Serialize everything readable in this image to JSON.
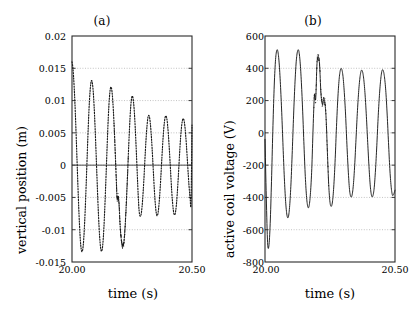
{
  "figure": {
    "background": "#ffffff",
    "line_color": "#1a1a1a",
    "grid_color": "#b4b4b4",
    "axis_color": "#2a2a2a"
  },
  "panels": [
    {
      "id": "a",
      "title": "(a)",
      "xlabel": "time (s)",
      "ylabel": "vertical position (m)",
      "xticks": [
        "20.00",
        "20.50"
      ],
      "yticks": [
        "0.02",
        "0.015",
        "0.01",
        "0.005",
        "0",
        "-0.005",
        "-0.01",
        "-0.015"
      ]
    },
    {
      "id": "b",
      "title": "(b)",
      "xlabel": "time (s)",
      "ylabel": "active coil voltage (V)",
      "xticks": [
        "20.00",
        "20.50"
      ],
      "yticks": [
        "600",
        "400",
        "200",
        "0",
        "-200",
        "-400",
        "-600",
        "-800"
      ]
    }
  ],
  "chart_data": [
    {
      "type": "line",
      "panel": "a",
      "title": "(a)",
      "xlabel": "time (s)",
      "ylabel": "vertical position (m)",
      "xlim": [
        20.0,
        20.5
      ],
      "ylim": [
        -0.015,
        0.02
      ],
      "xticks": [
        20.0,
        20.5
      ],
      "xticklabels": [
        "20.00",
        "20.50"
      ],
      "yticks": [
        0.02,
        0.015,
        0.01,
        0.005,
        0,
        -0.005,
        -0.01,
        -0.015
      ],
      "yticklabels": [
        "0.02",
        "0.015",
        "0.01",
        "0.005",
        "0",
        "-0.005",
        "-0.01",
        "-0.015"
      ],
      "grid": true,
      "grid_axis": "y",
      "linestyle": "dotted",
      "legend": null,
      "series": [
        {
          "name": "vertical position",
          "x": [
            20.0,
            20.004,
            20.008,
            20.012,
            20.016,
            20.02,
            20.024,
            20.028,
            20.032,
            20.036,
            20.04,
            20.044,
            20.048,
            20.052,
            20.056,
            20.06,
            20.064,
            20.068,
            20.072,
            20.076,
            20.08,
            20.084,
            20.088,
            20.092,
            20.096,
            20.1,
            20.104,
            20.108,
            20.112,
            20.116,
            20.12,
            20.124,
            20.128,
            20.132,
            20.136,
            20.14,
            20.144,
            20.148,
            20.152,
            20.156,
            20.16,
            20.164,
            20.168,
            20.172,
            20.176,
            20.18,
            20.184,
            20.188,
            20.192,
            20.196,
            20.2,
            20.204,
            20.208,
            20.212,
            20.216,
            20.22,
            20.224,
            20.228,
            20.232,
            20.236,
            20.24,
            20.244,
            20.248,
            20.252,
            20.256,
            20.26,
            20.264,
            20.268,
            20.272,
            20.276,
            20.28,
            20.284,
            20.288,
            20.292,
            20.296,
            20.3,
            20.304,
            20.308,
            20.312,
            20.316,
            20.32,
            20.324,
            20.328,
            20.332,
            20.336,
            20.34,
            20.344,
            20.348,
            20.352,
            20.356,
            20.36,
            20.364,
            20.368,
            20.372,
            20.376,
            20.38,
            20.384,
            20.388,
            20.392,
            20.396,
            20.4,
            20.404,
            20.408,
            20.412,
            20.416,
            20.42,
            20.424,
            20.428,
            20.432,
            20.436,
            20.44,
            20.444,
            20.448,
            20.452,
            20.456,
            20.46,
            20.464,
            20.468,
            20.472,
            20.476,
            20.48,
            20.484,
            20.488,
            20.492,
            20.496,
            20.5
          ],
          "y": [
            0.016,
            0.015,
            0.0128,
            0.0098,
            0.006,
            0.0018,
            -0.0025,
            -0.0065,
            -0.0098,
            -0.0122,
            -0.0133,
            -0.0132,
            -0.0119,
            -0.0094,
            -0.006,
            -0.002,
            0.0022,
            0.0062,
            0.0095,
            0.0118,
            0.013,
            0.0129,
            0.0116,
            0.0092,
            0.006,
            0.0022,
            -0.0018,
            -0.0057,
            -0.009,
            -0.0115,
            -0.013,
            -0.0133,
            -0.0124,
            -0.0103,
            -0.0072,
            -0.0035,
            0.0005,
            0.0045,
            0.008,
            0.0105,
            0.0119,
            0.012,
            0.0109,
            0.0087,
            0.0057,
            0.0021,
            -0.0017,
            -0.0052,
            -0.0048,
            -0.006,
            -0.009,
            -0.011,
            -0.0122,
            -0.0126,
            -0.012,
            -0.0103,
            -0.0077,
            -0.0045,
            -0.001,
            0.0027,
            0.006,
            0.0087,
            0.0103,
            0.0107,
            0.0099,
            0.0081,
            0.0054,
            0.0021,
            -0.0014,
            -0.0048,
            -0.0072,
            -0.0079,
            -0.0076,
            -0.0064,
            -0.0044,
            -0.0019,
            0.001,
            0.0037,
            0.0058,
            0.0073,
            0.0077,
            0.0072,
            0.0058,
            0.0037,
            0.0011,
            -0.0017,
            -0.0044,
            -0.0064,
            -0.0076,
            -0.0078,
            -0.007,
            -0.0054,
            -0.0032,
            -0.0006,
            0.0021,
            0.0045,
            0.0063,
            0.0074,
            0.0076,
            0.007,
            0.0055,
            0.0034,
            0.0009,
            -0.0018,
            -0.0043,
            -0.0062,
            -0.0074,
            -0.0077,
            -0.0071,
            -0.0057,
            -0.0036,
            -0.0011,
            0.0016,
            0.004,
            0.0058,
            0.0069,
            0.0072,
            0.0067,
            0.0054,
            0.0035,
            0.0012,
            -0.0012,
            -0.0034,
            -0.005,
            -0.0058,
            0.0062
          ]
        }
      ],
      "notes": "Decaying/modulated oscillation, dotted trace; amplitude decays from ~0.016 m to ~0.007 m; a noise burst appears near t = 20.18-20.23 s."
    },
    {
      "type": "line",
      "panel": "b",
      "title": "(b)",
      "xlabel": "time (s)",
      "ylabel": "active coil voltage (V)",
      "xlim": [
        20.0,
        20.5
      ],
      "ylim": [
        -800,
        600
      ],
      "xticks": [
        20.0,
        20.5
      ],
      "xticklabels": [
        "20.00",
        "20.50"
      ],
      "yticks": [
        600,
        400,
        200,
        0,
        -200,
        -400,
        -600,
        -800
      ],
      "yticklabels": [
        "600",
        "400",
        "200",
        "0",
        "-200",
        "-400",
        "-600",
        "-800"
      ],
      "grid": true,
      "grid_axis": "y",
      "linestyle": "solid",
      "legend": null,
      "series": [
        {
          "name": "active coil voltage",
          "x": [
            20.0,
            20.005,
            20.01,
            20.015,
            20.02,
            20.025,
            20.03,
            20.035,
            20.04,
            20.045,
            20.05,
            20.055,
            20.06,
            20.065,
            20.07,
            20.075,
            20.08,
            20.085,
            20.09,
            20.095,
            20.1,
            20.105,
            20.11,
            20.115,
            20.12,
            20.125,
            20.13,
            20.135,
            20.14,
            20.145,
            20.15,
            20.155,
            20.16,
            20.165,
            20.17,
            20.175,
            20.18,
            20.185,
            20.19,
            20.195,
            20.2,
            20.205,
            20.21,
            20.215,
            20.22,
            20.225,
            20.23,
            20.235,
            20.24,
            20.245,
            20.25,
            20.255,
            20.26,
            20.265,
            20.27,
            20.275,
            20.28,
            20.285,
            20.29,
            20.295,
            20.3,
            20.305,
            20.31,
            20.315,
            20.32,
            20.325,
            20.33,
            20.335,
            20.34,
            20.345,
            20.35,
            20.355,
            20.36,
            20.365,
            20.37,
            20.375,
            20.38,
            20.385,
            20.39,
            20.395,
            20.4,
            20.405,
            20.41,
            20.415,
            20.42,
            20.425,
            20.43,
            20.435,
            20.44,
            20.445,
            20.45,
            20.455,
            20.46,
            20.465,
            20.47,
            20.475,
            20.48,
            20.485,
            20.49,
            20.495,
            20.5
          ],
          "y": [
            -40,
            -400,
            -680,
            -700,
            -560,
            -300,
            10,
            270,
            440,
            510,
            500,
            420,
            280,
            100,
            -110,
            -300,
            -440,
            -515,
            -520,
            -450,
            -310,
            -110,
            110,
            300,
            440,
            505,
            508,
            440,
            310,
            130,
            -80,
            -270,
            -400,
            -460,
            -450,
            -370,
            -220,
            30,
            230,
            210,
            430,
            470,
            420,
            250,
            180,
            200,
            190,
            90,
            -120,
            -320,
            -430,
            -455,
            -420,
            -320,
            -160,
            40,
            210,
            330,
            390,
            395,
            350,
            250,
            110,
            -70,
            -230,
            -350,
            -395,
            -385,
            -320,
            -200,
            -40,
            120,
            250,
            340,
            385,
            380,
            330,
            235,
            100,
            -60,
            -210,
            -330,
            -390,
            -390,
            -340,
            -230,
            -80,
            90,
            230,
            330,
            385,
            385,
            340,
            250,
            110,
            -60,
            -220,
            -330,
            -385,
            -380,
            -355
          ]
        }
      ],
      "notes": "Solid oscillating trace, period ~0.09 s; peak ~+510 V early decaying to ~+390 V, trough down to ~-700 V at start; a high-frequency noise burst occurs near t = 20.19-20.24 s."
    }
  ]
}
